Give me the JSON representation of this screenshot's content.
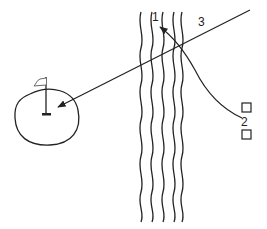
{
  "diagram": {
    "labels": {
      "path_1": "1",
      "path_2": "2",
      "path_3": "3"
    },
    "elements": {
      "green": "putting-green",
      "flag": "flag-icon",
      "hole": "hole-cup",
      "water": "water-hazard",
      "tee_top": "tee-marker",
      "tee_bottom": "tee-marker"
    },
    "colors": {
      "stroke": "#222222",
      "background": "#ffffff"
    }
  }
}
